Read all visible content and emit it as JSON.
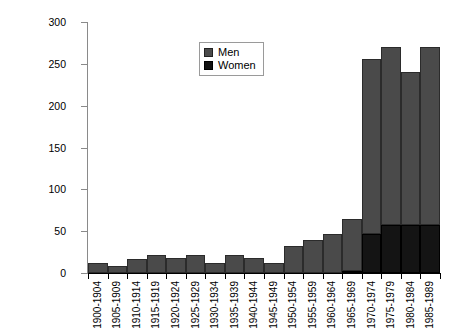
{
  "chart_data": {
    "type": "bar",
    "stacked": true,
    "title": "",
    "xlabel": "",
    "ylabel": "",
    "ylim": [
      0,
      300
    ],
    "yticks": [
      0,
      50,
      100,
      150,
      200,
      250,
      300
    ],
    "grid": false,
    "legend_position": "top-center",
    "categories": [
      "1900-1904",
      "1905-1909",
      "1910-1914",
      "1915-1919",
      "1920-1924",
      "1925-1929",
      "1930-1934",
      "1935-1939",
      "1940-1944",
      "1945-1949",
      "1950-1954",
      "1955-1959",
      "1960-1964",
      "1965-1969",
      "1970-1974",
      "1975-1979",
      "1980-1984",
      "1985-1989"
    ],
    "series": [
      {
        "name": "Men",
        "color": "#4a4a4a",
        "values": [
          12,
          8,
          17,
          22,
          18,
          22,
          12,
          22,
          18,
          12,
          32,
          40,
          47,
          63,
          209,
          213,
          183,
          213
        ]
      },
      {
        "name": "Women",
        "color": "#141414",
        "values": [
          0,
          0,
          0,
          0,
          0,
          0,
          0,
          0,
          0,
          0,
          0,
          0,
          0,
          2,
          47,
          57,
          57,
          57
        ]
      }
    ],
    "totals": [
      12,
      8,
      17,
      22,
      18,
      22,
      12,
      22,
      18,
      12,
      32,
      40,
      47,
      65,
      256,
      270,
      240,
      270
    ]
  },
  "legend": {
    "entries": [
      {
        "label": "Men"
      },
      {
        "label": "Women"
      }
    ]
  }
}
